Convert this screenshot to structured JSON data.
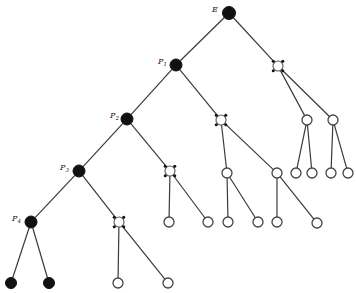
{
  "diagram": {
    "type": "tree",
    "width": 356,
    "height": 293,
    "colors": {
      "edge": "#3a3a3a",
      "filled": "#111111",
      "open_stroke": "#444444"
    },
    "nodes": [
      {
        "id": "E",
        "x": 229,
        "y": 13,
        "kind": "filled",
        "r": 6.5,
        "label": "E",
        "label_x": 212,
        "label_y": 12
      },
      {
        "id": "P1",
        "x": 176,
        "y": 65,
        "kind": "filled",
        "r": 6,
        "label": "P1",
        "label_x": 158,
        "label_y": 64
      },
      {
        "id": "R1",
        "x": 278,
        "y": 66,
        "kind": "dotted",
        "r": 5
      },
      {
        "id": "P2",
        "x": 127,
        "y": 119,
        "kind": "filled",
        "r": 6,
        "label": "P2",
        "label_x": 110,
        "label_y": 118
      },
      {
        "id": "R2",
        "x": 221,
        "y": 120,
        "kind": "dotted",
        "r": 5
      },
      {
        "id": "R1a",
        "x": 307,
        "y": 120,
        "kind": "open",
        "r": 5
      },
      {
        "id": "R1b",
        "x": 333,
        "y": 120,
        "kind": "open",
        "r": 5
      },
      {
        "id": "P3",
        "x": 79,
        "y": 171,
        "kind": "filled",
        "r": 6,
        "label": "P3",
        "label_x": 60,
        "label_y": 170
      },
      {
        "id": "R3",
        "x": 170,
        "y": 171,
        "kind": "dotted",
        "r": 5
      },
      {
        "id": "R2a",
        "x": 227,
        "y": 173,
        "kind": "open",
        "r": 5
      },
      {
        "id": "R2b",
        "x": 277,
        "y": 173,
        "kind": "open",
        "r": 5
      },
      {
        "id": "R1a1",
        "x": 296,
        "y": 173,
        "kind": "open",
        "r": 5
      },
      {
        "id": "R1a2",
        "x": 312,
        "y": 173,
        "kind": "open",
        "r": 5
      },
      {
        "id": "R1b1",
        "x": 331,
        "y": 173,
        "kind": "open",
        "r": 5
      },
      {
        "id": "R1b2",
        "x": 348,
        "y": 173,
        "kind": "open",
        "r": 5
      },
      {
        "id": "P4",
        "x": 31,
        "y": 222,
        "kind": "filled",
        "r": 6,
        "label": "P4",
        "label_x": 12,
        "label_y": 221
      },
      {
        "id": "R4",
        "x": 119,
        "y": 222,
        "kind": "dotted",
        "r": 5
      },
      {
        "id": "R3a",
        "x": 169,
        "y": 222,
        "kind": "open",
        "r": 5
      },
      {
        "id": "R3b",
        "x": 208,
        "y": 222,
        "kind": "open",
        "r": 5
      },
      {
        "id": "R2a1",
        "x": 228,
        "y": 222,
        "kind": "open",
        "r": 5
      },
      {
        "id": "R2a2",
        "x": 258,
        "y": 222,
        "kind": "open",
        "r": 5
      },
      {
        "id": "R2b1",
        "x": 277,
        "y": 222,
        "kind": "open",
        "r": 5
      },
      {
        "id": "R2b2",
        "x": 317,
        "y": 223,
        "kind": "open",
        "r": 5
      },
      {
        "id": "P4a",
        "x": 11,
        "y": 283,
        "kind": "filled",
        "r": 5.5
      },
      {
        "id": "P4b",
        "x": 49,
        "y": 283,
        "kind": "filled",
        "r": 5.5
      },
      {
        "id": "R4a",
        "x": 118,
        "y": 283,
        "kind": "open",
        "r": 5
      },
      {
        "id": "R4b",
        "x": 168,
        "y": 283,
        "kind": "open",
        "r": 5
      }
    ],
    "edges": [
      [
        "E",
        "P1"
      ],
      [
        "E",
        "R1"
      ],
      [
        "P1",
        "P2"
      ],
      [
        "P1",
        "R2"
      ],
      [
        "R1",
        "R1a"
      ],
      [
        "R1",
        "R1b"
      ],
      [
        "P2",
        "P3"
      ],
      [
        "P2",
        "R3"
      ],
      [
        "R2",
        "R2a"
      ],
      [
        "R2",
        "R2b"
      ],
      [
        "R1a",
        "R1a1"
      ],
      [
        "R1a",
        "R1a2"
      ],
      [
        "R1b",
        "R1b1"
      ],
      [
        "R1b",
        "R1b2"
      ],
      [
        "P3",
        "P4"
      ],
      [
        "P3",
        "R4"
      ],
      [
        "R3",
        "R3a"
      ],
      [
        "R3",
        "R3b"
      ],
      [
        "R2a",
        "R2a1"
      ],
      [
        "R2a",
        "R2a2"
      ],
      [
        "R2b",
        "R2b1"
      ],
      [
        "R2b",
        "R2b2"
      ],
      [
        "P4",
        "P4a"
      ],
      [
        "P4",
        "P4b"
      ],
      [
        "R4",
        "R4a"
      ],
      [
        "R4",
        "R4b"
      ]
    ]
  }
}
